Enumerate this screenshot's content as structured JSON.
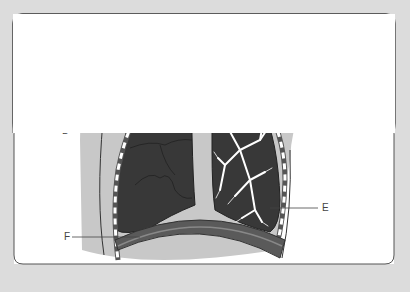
{
  "diagram": {
    "colors": {
      "background": "#dcdcdc",
      "panel": "#ffffff",
      "torso": "#c8c8c8",
      "lung": "#3a3a3a",
      "bronchi": "#ffffff",
      "diaphragm": "#5a5a5a",
      "rib_cartilage": "#ffffff",
      "leader_lines": "#444444"
    },
    "labels": [
      {
        "id": "A",
        "text": "A",
        "target": "larynx / upper trachea"
      },
      {
        "id": "B",
        "text": "B",
        "target": "trachea"
      },
      {
        "id": "C",
        "text": "C",
        "target": "bronchial tree"
      },
      {
        "id": "D",
        "text": "D",
        "target": "lung"
      },
      {
        "id": "E",
        "text": "E",
        "target": "pleura / ribs"
      },
      {
        "id": "F",
        "text": "F",
        "target": "diaphragm"
      }
    ]
  }
}
